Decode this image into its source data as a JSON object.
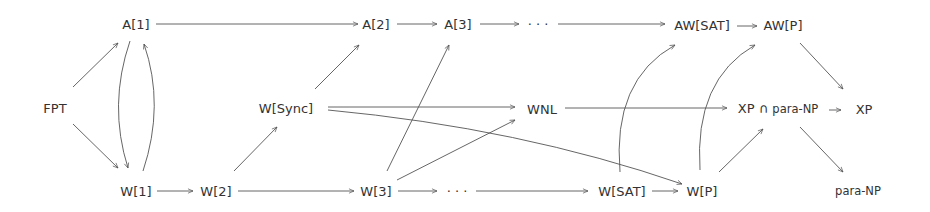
{
  "diagram": {
    "type": "parameterized-complexity-class-hierarchy",
    "nodes": [
      {
        "id": "FPT",
        "label": "FPT",
        "x": 55,
        "y": 108
      },
      {
        "id": "A1",
        "label": "A[1]",
        "x": 136,
        "y": 24
      },
      {
        "id": "A2",
        "label": "A[2]",
        "x": 373,
        "y": 24
      },
      {
        "id": "A3",
        "label": "A[3]",
        "x": 455,
        "y": 24
      },
      {
        "id": "Adots",
        "label": "· · ·",
        "x": 535,
        "y": 24
      },
      {
        "id": "AWSAT",
        "label": "AW[SAT]",
        "x": 702,
        "y": 24
      },
      {
        "id": "AWP",
        "label": "AW[P]",
        "x": 783,
        "y": 24
      },
      {
        "id": "WSync",
        "label": "W[Sync]",
        "x": 282,
        "y": 108
      },
      {
        "id": "WNL",
        "label": "WNL",
        "x": 540,
        "y": 108
      },
      {
        "id": "XPparaNP",
        "label": "XP ∩ para-NP",
        "x": 806,
        "y": 108
      },
      {
        "id": "XP",
        "label": "XP",
        "x": 863,
        "y": 108
      },
      {
        "id": "W1",
        "label": "W[1]",
        "x": 136,
        "y": 191
      },
      {
        "id": "W2",
        "label": "W[2]",
        "x": 223,
        "y": 191
      },
      {
        "id": "W3",
        "label": "W[3]",
        "x": 375,
        "y": 191
      },
      {
        "id": "Wdots",
        "label": "· · ·",
        "x": 455,
        "y": 191
      },
      {
        "id": "WSAT",
        "label": "W[SAT]",
        "x": 628,
        "y": 191
      },
      {
        "id": "WP",
        "label": "W[P]",
        "x": 701,
        "y": 191
      },
      {
        "id": "paraNP",
        "label": "para-NP",
        "x": 855,
        "y": 191
      }
    ],
    "edges": [
      {
        "from": "FPT",
        "to": "A1"
      },
      {
        "from": "FPT",
        "to": "W1"
      },
      {
        "from": "A1",
        "to": "W1",
        "curve": "left"
      },
      {
        "from": "W1",
        "to": "A1",
        "curve": "right"
      },
      {
        "from": "A1",
        "to": "A2"
      },
      {
        "from": "A2",
        "to": "A3"
      },
      {
        "from": "A3",
        "to": "Adots"
      },
      {
        "from": "Adots",
        "to": "AWSAT"
      },
      {
        "from": "AWSAT",
        "to": "AWP"
      },
      {
        "from": "W1",
        "to": "W2"
      },
      {
        "from": "W2",
        "to": "W3"
      },
      {
        "from": "W2",
        "to": "WSync"
      },
      {
        "from": "WSync",
        "to": "A2"
      },
      {
        "from": "WSync",
        "to": "WNL"
      },
      {
        "from": "WSync",
        "to": "WP"
      },
      {
        "from": "W3",
        "to": "A3"
      },
      {
        "from": "W3",
        "to": "WNL"
      },
      {
        "from": "W3",
        "to": "Wdots"
      },
      {
        "from": "Wdots",
        "to": "WSAT"
      },
      {
        "from": "WSAT",
        "to": "WP"
      },
      {
        "from": "WSAT",
        "to": "AWSAT",
        "curve": "up"
      },
      {
        "from": "WP",
        "to": "AWP",
        "curve": "up"
      },
      {
        "from": "WP",
        "to": "XPparaNP"
      },
      {
        "from": "WNL",
        "to": "XPparaNP"
      },
      {
        "from": "AWP",
        "to": "XP"
      },
      {
        "from": "XPparaNP",
        "to": "XP"
      },
      {
        "from": "XPparaNP",
        "to": "paraNP"
      }
    ]
  },
  "labels": {
    "FPT": "FPT",
    "A1": "A[1]",
    "A2": "A[2]",
    "A3": "A[3]",
    "Adots": "· · ·",
    "AWSAT": "AW[SAT]",
    "AWP": "AW[P]",
    "WSync": "W[Sync]",
    "WNL": "WNL",
    "XP_cap": "XP ∩",
    "XP_cap_paraNP": "para-NP",
    "XP": "XP",
    "W1": "W[1]",
    "W2": "W[2]",
    "W3": "W[3]",
    "Wdots": "· · ·",
    "WSAT": "W[SAT]",
    "WP": "W[P]",
    "paraNP": "para-NP"
  },
  "colors": {
    "edge": "#555555",
    "text": "#333333",
    "background": "#ffffff"
  }
}
